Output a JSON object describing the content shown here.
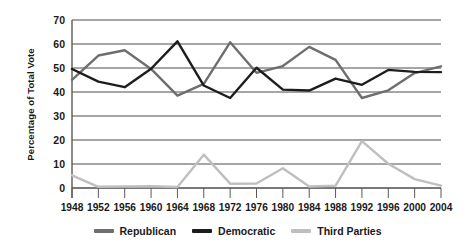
{
  "chart_data": {
    "type": "line",
    "title": "",
    "xlabel": "",
    "ylabel": "Percentage of Total Vote",
    "categories": [
      "1948",
      "1952",
      "1956",
      "1960",
      "1964",
      "1968",
      "1972",
      "1976",
      "1980",
      "1984",
      "1988",
      "1992",
      "1996",
      "2000",
      "2004"
    ],
    "xticklabels": [
      "1948",
      "1952",
      "1956",
      "1960",
      "1964",
      "1968",
      "1972",
      "1976",
      "1980",
      "1984",
      "1988",
      "1992",
      "1996",
      "2000",
      "2004"
    ],
    "yticklabels": [
      "0",
      "10",
      "20",
      "30",
      "40",
      "50",
      "60",
      "70"
    ],
    "ylim": [
      0,
      70
    ],
    "ytick_step": 10,
    "grid": "horizontal",
    "legend_position": "bottom-center",
    "series": [
      {
        "name": "Republican",
        "color": "#6e6e6e",
        "values": [
          45.1,
          55.2,
          57.4,
          49.6,
          38.5,
          43.4,
          60.7,
          48.0,
          50.8,
          58.8,
          53.4,
          37.5,
          40.7,
          47.9,
          50.7
        ]
      },
      {
        "name": "Democratic",
        "color": "#1d1d1d",
        "values": [
          49.6,
          44.3,
          42.0,
          49.7,
          61.1,
          42.7,
          37.5,
          50.1,
          41.0,
          40.6,
          45.6,
          43.0,
          49.2,
          48.4,
          48.3
        ]
      },
      {
        "name": "Third Parties",
        "color": "#bfbfbf",
        "values": [
          5.3,
          0.5,
          0.6,
          0.7,
          0.4,
          13.9,
          1.8,
          1.9,
          8.2,
          0.6,
          1.0,
          19.5,
          10.1,
          3.7,
          1.0
        ]
      }
    ],
    "legend": [
      {
        "label": "Republican",
        "color": "#6e6e6e"
      },
      {
        "label": "Democratic",
        "color": "#1d1d1d"
      },
      {
        "label": "Third Parties",
        "color": "#bfbfbf"
      }
    ],
    "axis_color": "#5a5a5a",
    "grid_color": "#4d4d4d"
  }
}
